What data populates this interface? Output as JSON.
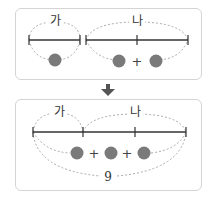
{
  "top_panel": {
    "label_a": "가",
    "label_b": "나",
    "plus": "+"
  },
  "arrow": {
    "icon": "down-arrow-icon",
    "color": "#555555"
  },
  "bottom_panel": {
    "label_a": "가",
    "label_b": "나",
    "plus1": "+",
    "plus2": "+",
    "total": "9"
  },
  "colors": {
    "circle": "#7a7a7a",
    "line": "#333333",
    "dashed": "#aaaaaa",
    "border": "#d4d4d4"
  }
}
